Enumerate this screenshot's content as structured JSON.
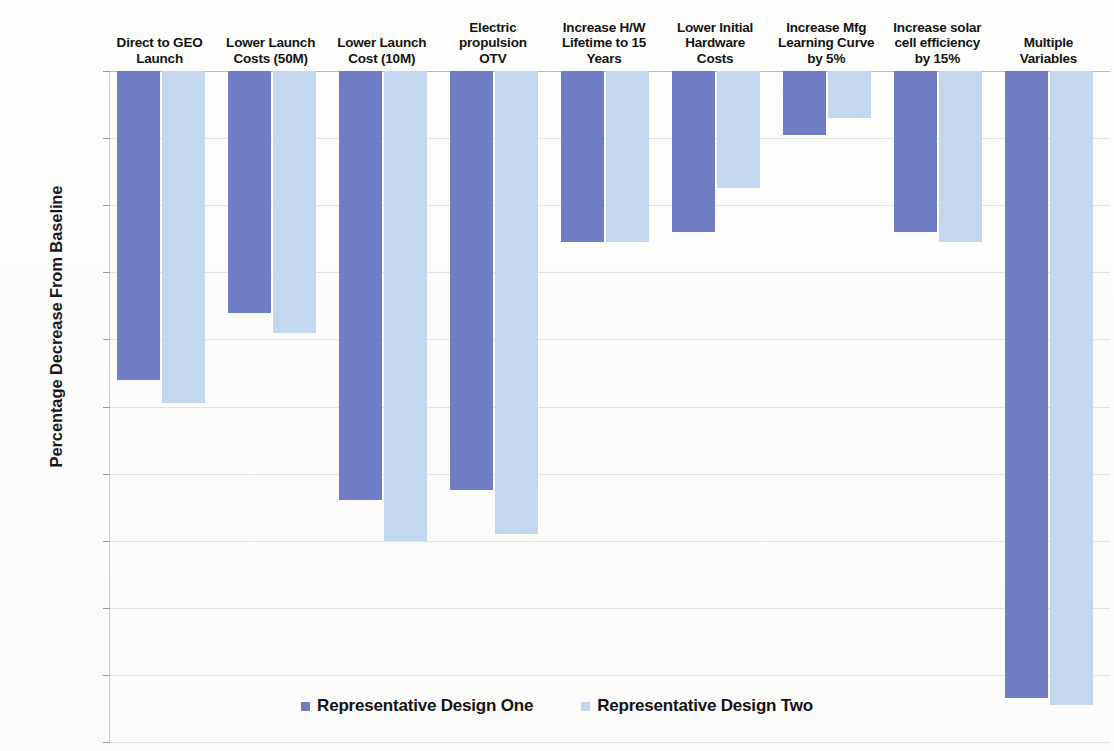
{
  "chart_data": {
    "type": "bar",
    "title": "",
    "xlabel": "",
    "ylabel": "Percentage Decrease From Baseline",
    "ylim": [
      -100,
      0
    ],
    "ytick_step": 10,
    "grid": true,
    "legend_position": "bottom",
    "orientation": "vertical",
    "categories": [
      "Direct to GEO Launch",
      "Lower Launch Costs (50M)",
      "Lower Launch Cost (10M)",
      "Electric propulsion OTV",
      "Increase H/W Lifetime to 15 Years",
      "Lower Initial Hardware Costs",
      "Increase Mfg Learning Curve by 5%",
      "Increase solar cell efficiency by 15%",
      "Multiple Variables"
    ],
    "category_lines": [
      [
        "Direct to GEO",
        "Launch"
      ],
      [
        "Lower Launch",
        "Costs (50M)"
      ],
      [
        "Lower Launch",
        "Cost (10M)"
      ],
      [
        "Electric",
        "propulsion",
        "OTV"
      ],
      [
        "Increase H/W",
        "Lifetime to 15",
        "Years"
      ],
      [
        "Lower Initial",
        "Hardware",
        "Costs"
      ],
      [
        "Increase Mfg",
        "Learning Curve",
        "by 5%"
      ],
      [
        "Increase solar",
        "cell efficiency",
        "by 15%"
      ],
      [
        "Multiple",
        "Variables"
      ]
    ],
    "ytick_labels": [
      "0%",
      "-10%",
      "-20%",
      "-30%",
      "-40%",
      "-50%",
      "-60%",
      "-70%",
      "-80%",
      "-90%",
      "-100%"
    ],
    "ytick_values": [
      0,
      -10,
      -20,
      -30,
      -40,
      -50,
      -60,
      -70,
      -80,
      -90,
      -100
    ],
    "series": [
      {
        "name": "Representative Design One",
        "color": "#6e7dc4",
        "values": [
          -46.0,
          -36.0,
          -64.0,
          -62.5,
          -25.5,
          -24.0,
          -9.5,
          -24.0,
          -93.5
        ]
      },
      {
        "name": "Representative Design Two",
        "color": "#c3d7f0",
        "values": [
          -49.5,
          -39.0,
          -70.0,
          -69.0,
          -25.5,
          -17.5,
          -7.0,
          -25.5,
          -94.5
        ]
      }
    ]
  },
  "legend": {
    "entries": [
      {
        "label": "Representative Design One",
        "swatch": "series-one"
      },
      {
        "label": "Representative Design Two",
        "swatch": "series-two"
      }
    ]
  }
}
